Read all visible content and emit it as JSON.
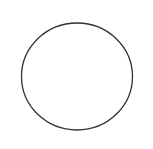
{
  "canvas": {
    "width": 153,
    "height": 149,
    "background": "#ffffff"
  },
  "shape": {
    "type": "circle-outline",
    "cx": 77,
    "cy": 76.5,
    "rx": 55.5,
    "ry": 53.5,
    "stroke": "#333333",
    "stroke_width": 1.3,
    "fill": "none"
  }
}
